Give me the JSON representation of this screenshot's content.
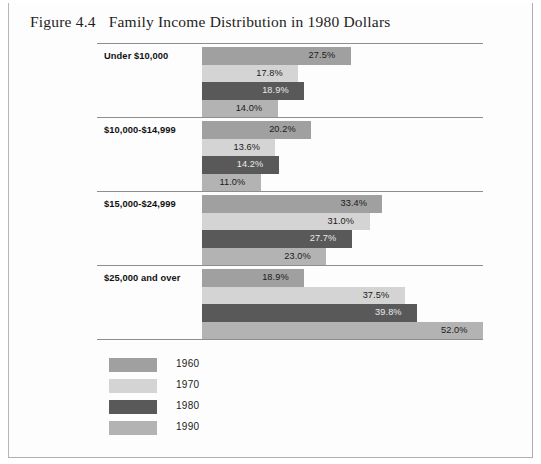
{
  "figure": {
    "number": "Figure 4.4",
    "title": "Family Income Distribution in 1980 Dollars"
  },
  "chart_data": {
    "type": "bar",
    "orientation": "horizontal",
    "title": "Family Income Distribution in 1980 Dollars",
    "xlabel": "",
    "ylabel": "",
    "xlim": [
      0,
      52.0
    ],
    "grid": false,
    "legend_position": "bottom-left",
    "categories": [
      "Under $10,000",
      "$10,000-$14,999",
      "$15,000-$24,999",
      "$25,000 and over"
    ],
    "series": [
      {
        "name": "1960",
        "color": "#a0a0a0",
        "values": [
          27.5,
          20.2,
          33.4,
          18.9
        ],
        "labels": [
          "27.5%",
          "20.2%",
          "33.4%",
          "18.9%"
        ]
      },
      {
        "name": "1970",
        "color": "#d4d4d4",
        "values": [
          17.8,
          13.6,
          31.0,
          37.5
        ],
        "labels": [
          "17.8%",
          "13.6%",
          "31.0%",
          "37.5%"
        ]
      },
      {
        "name": "1980",
        "color": "#595959",
        "values": [
          18.9,
          14.2,
          27.7,
          39.8
        ],
        "labels": [
          "18.9%",
          "14.2%",
          "27.7%",
          "39.8%"
        ]
      },
      {
        "name": "1990",
        "color": "#b3b3b3",
        "values": [
          14.0,
          11.0,
          23.0,
          52.0
        ],
        "labels": [
          "14.0%",
          "11.0%",
          "23.0%",
          "52.0%"
        ]
      }
    ]
  },
  "legend": {
    "items": [
      {
        "label": "1960",
        "color": "#a0a0a0"
      },
      {
        "label": "1970",
        "color": "#d4d4d4"
      },
      {
        "label": "1980",
        "color": "#595959"
      },
      {
        "label": "1990",
        "color": "#b3b3b3"
      }
    ]
  }
}
